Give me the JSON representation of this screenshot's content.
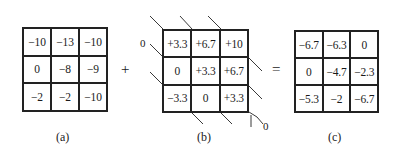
{
  "figure": {
    "panels": [
      {
        "id": "a",
        "caption": "(a)",
        "cells": [
          [
            "−10",
            "−13",
            "−10"
          ],
          [
            "0",
            "−8",
            "−9"
          ],
          [
            "−2",
            "−2",
            "−10"
          ]
        ]
      },
      {
        "id": "b",
        "caption": "(b)",
        "cells": [
          [
            "+3.3",
            "+6.7",
            "+10"
          ],
          [
            "0",
            "+3.3",
            "+6.7"
          ],
          [
            "−3.3",
            "0",
            "+3.3"
          ]
        ],
        "zero_labels": [
          "0",
          "0"
        ]
      },
      {
        "id": "c",
        "caption": "(c)",
        "cells": [
          [
            "−6.7",
            "−6.3",
            "0"
          ],
          [
            "0",
            "−4.7",
            "−2.3"
          ],
          [
            "−5.3",
            "−2",
            "−6.7"
          ]
        ]
      }
    ],
    "operators": {
      "plus": "+",
      "equals": "="
    }
  }
}
